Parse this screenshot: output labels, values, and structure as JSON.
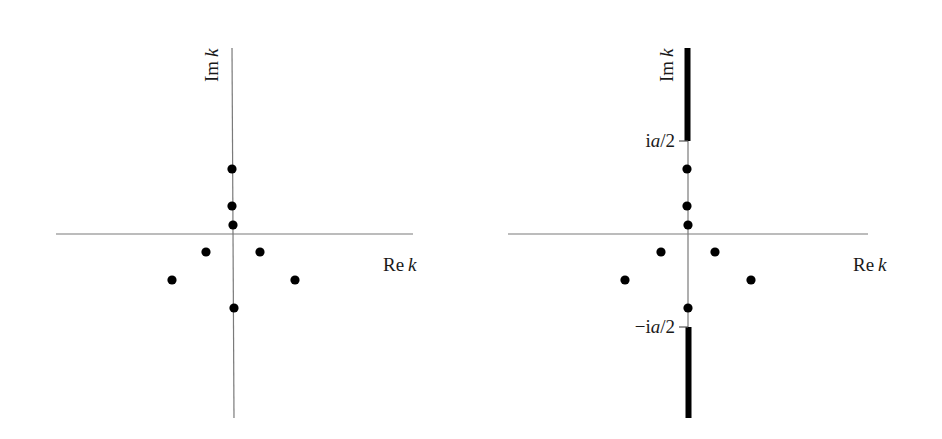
{
  "panels": [
    {
      "id": "left",
      "axes": {
        "x_label_re": "Re",
        "x_label_var": "k",
        "y_label_im": "Im",
        "y_label_var": "k"
      },
      "points": [
        {
          "name": "pole-imag-upper-3",
          "x": 232,
          "y": 169
        },
        {
          "name": "pole-imag-upper-2",
          "x": 232,
          "y": 206
        },
        {
          "name": "pole-imag-upper-1",
          "x": 233,
          "y": 225
        },
        {
          "name": "pole-lower-left-inner",
          "x": 206,
          "y": 252
        },
        {
          "name": "pole-lower-right-inner",
          "x": 260,
          "y": 252
        },
        {
          "name": "pole-lower-left-outer",
          "x": 172,
          "y": 280
        },
        {
          "name": "pole-lower-right-outer",
          "x": 295,
          "y": 280
        },
        {
          "name": "pole-imag-lower",
          "x": 234,
          "y": 308
        }
      ]
    },
    {
      "id": "right",
      "axes": {
        "x_label_re": "Re",
        "x_label_var": "k",
        "y_label_im": "Im",
        "y_label_var": "k"
      },
      "ticks": {
        "upper": {
          "pre": "i",
          "var": "a",
          "post": "/2"
        },
        "lower": {
          "pre": "−i",
          "var": "a",
          "post": "/2"
        }
      },
      "branch_cuts": [
        {
          "name": "upper-cut",
          "from": "ia/2",
          "to": "+i∞"
        },
        {
          "name": "lower-cut",
          "from": "-ia/2",
          "to": "-i∞"
        }
      ],
      "points": [
        {
          "name": "pole-imag-upper-3",
          "x": 687,
          "y": 169
        },
        {
          "name": "pole-imag-upper-2",
          "x": 687,
          "y": 206
        },
        {
          "name": "pole-imag-upper-1",
          "x": 688,
          "y": 225
        },
        {
          "name": "pole-lower-left-inner",
          "x": 661,
          "y": 252
        },
        {
          "name": "pole-lower-right-inner",
          "x": 715,
          "y": 252
        },
        {
          "name": "pole-lower-left-outer",
          "x": 625,
          "y": 280
        },
        {
          "name": "pole-lower-right-outer",
          "x": 751,
          "y": 280
        },
        {
          "name": "pole-imag-lower",
          "x": 688,
          "y": 308
        }
      ]
    }
  ],
  "colors": {
    "axis": "#7a7a7a",
    "ink": "#000000"
  }
}
